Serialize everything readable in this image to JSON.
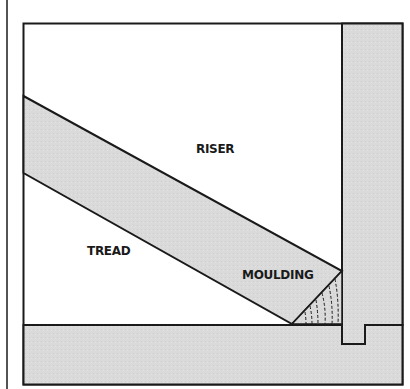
{
  "diagram": {
    "type": "cross-section illustration",
    "labels": {
      "riser": "RISER",
      "tread": "TREAD",
      "moulding": "MOULDING"
    },
    "colors": {
      "background": "#ffffff",
      "wood_fill": "#d9d9d9",
      "stroke": "#1a1a1a"
    }
  }
}
